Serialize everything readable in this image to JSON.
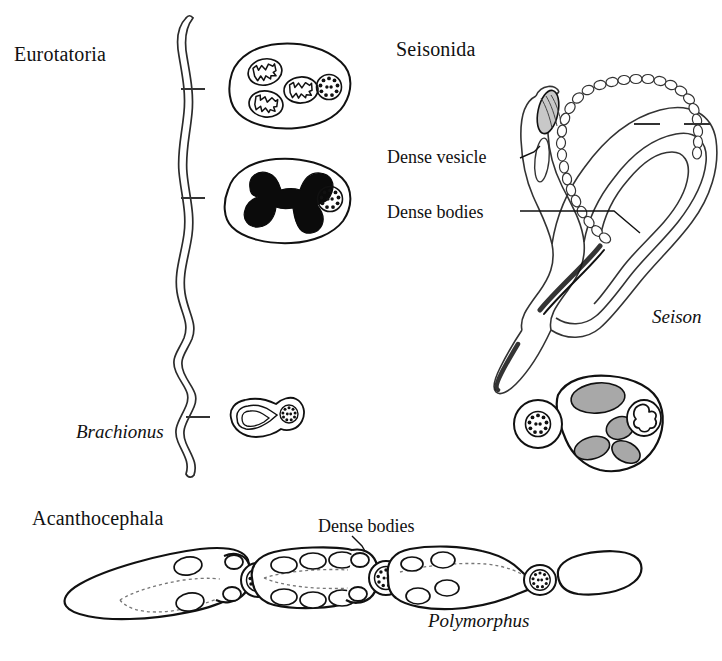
{
  "figure": {
    "background_color": "#ffffff",
    "ink_color": "#111111",
    "shading_color": "#a8a8a8"
  },
  "groups": [
    {
      "id": "eurotatoria",
      "label": "Eurotatoria"
    },
    {
      "id": "seisonida",
      "label": "Seisonida"
    },
    {
      "id": "acanthocephala",
      "label": "Acanthocephala"
    }
  ],
  "taxa": [
    {
      "id": "brachionus",
      "label": "Brachionus",
      "style": "italic"
    },
    {
      "id": "seison",
      "label": "Seison",
      "style": "italic"
    },
    {
      "id": "polymorphus",
      "label": "Polymorphus",
      "style": "italic"
    }
  ],
  "callouts": [
    {
      "id": "dense-vesicle",
      "label": "Dense vesicle"
    },
    {
      "id": "dense-bodies-seison",
      "label": "Dense bodies"
    },
    {
      "id": "dense-bodies-acanth",
      "label": "Dense bodies"
    }
  ],
  "panels": {
    "eurotatoria": {
      "taxon": "Brachionus",
      "leader_ticks": 3,
      "sections": [
        {
          "id": "mitochondrial-section",
          "mitochondria": 3,
          "axoneme": "9+2",
          "nucleus_shading": "outline"
        },
        {
          "id": "nuclear-section",
          "mitochondria": 0,
          "axoneme": "9+2",
          "nucleus_shading": "solid-black"
        },
        {
          "id": "tail-section",
          "mitochondria": 0,
          "axoneme": "9+2",
          "nucleus_shading": "outline"
        }
      ]
    },
    "seisonida": {
      "taxon": "Seison",
      "leader_ticks": 2,
      "features": [
        "Dense vesicle",
        "Dense bodies"
      ],
      "cross_section": {
        "id": "seison-cross-section",
        "dense_bodies": 4,
        "axoneme": "9+2",
        "nucleus_shading": "outline"
      }
    },
    "acanthocephala": {
      "taxon": "Polymorphus",
      "features": [
        "Dense bodies"
      ],
      "stages": [
        {
          "id": "stage-1",
          "dense_bodies": 2,
          "axoneme": "9+2"
        },
        {
          "id": "stage-2",
          "dense_bodies": 6,
          "axoneme": "9+2"
        },
        {
          "id": "stage-3",
          "dense_bodies": 4,
          "axoneme": "9+2"
        },
        {
          "id": "stage-4",
          "dense_bodies": 0,
          "axoneme": "none"
        }
      ]
    }
  }
}
